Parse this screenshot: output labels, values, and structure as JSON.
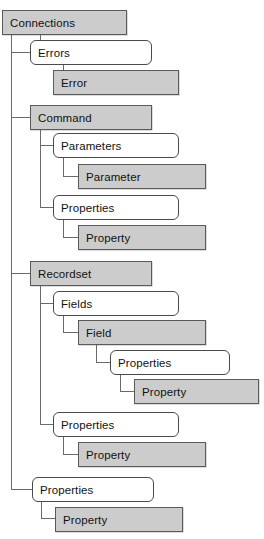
{
  "diagram": {
    "type": "tree-hierarchy",
    "colors": {
      "object_fill": "#cccccc",
      "collection_fill": "#ffffff",
      "border": "#5a5a5a",
      "connector": "#6a6a6a",
      "text": "#111111"
    },
    "legend": {
      "object_shape": "square-cornered gray box",
      "collection_shape": "rounded-corner white box"
    },
    "nodes": [
      {
        "id": "connections",
        "label": "Connections",
        "kind": "object",
        "depth": 0,
        "x": 2,
        "y": 10,
        "w": 125,
        "h": 25
      },
      {
        "id": "errors",
        "label": "Errors",
        "kind": "collection",
        "depth": 1,
        "x": 30,
        "y": 40,
        "w": 122,
        "h": 25
      },
      {
        "id": "error",
        "label": "Error",
        "kind": "object",
        "depth": 2,
        "x": 53,
        "y": 70,
        "w": 126,
        "h": 25
      },
      {
        "id": "command",
        "label": "Command",
        "kind": "object",
        "depth": 1,
        "x": 30,
        "y": 105,
        "w": 122,
        "h": 25
      },
      {
        "id": "parameters",
        "label": "Parameters",
        "kind": "collection",
        "depth": 2,
        "x": 53,
        "y": 133,
        "w": 126,
        "h": 25
      },
      {
        "id": "parameter",
        "label": "Parameter",
        "kind": "object",
        "depth": 3,
        "x": 78,
        "y": 164,
        "w": 128,
        "h": 25
      },
      {
        "id": "cmd-properties",
        "label": "Properties",
        "kind": "collection",
        "depth": 2,
        "x": 53,
        "y": 195,
        "w": 126,
        "h": 25
      },
      {
        "id": "cmd-property",
        "label": "Property",
        "kind": "object",
        "depth": 3,
        "x": 78,
        "y": 225,
        "w": 128,
        "h": 25
      },
      {
        "id": "recordset",
        "label": "Recordset",
        "kind": "object",
        "depth": 1,
        "x": 30,
        "y": 261,
        "w": 122,
        "h": 25
      },
      {
        "id": "fields",
        "label": "Fields",
        "kind": "collection",
        "depth": 2,
        "x": 53,
        "y": 291,
        "w": 126,
        "h": 25
      },
      {
        "id": "field",
        "label": "Field",
        "kind": "object",
        "depth": 3,
        "x": 78,
        "y": 320,
        "w": 128,
        "h": 25
      },
      {
        "id": "field-properties",
        "label": "Properties",
        "kind": "collection",
        "depth": 4,
        "x": 110,
        "y": 350,
        "w": 120,
        "h": 25
      },
      {
        "id": "field-property",
        "label": "Property",
        "kind": "object",
        "depth": 5,
        "x": 134,
        "y": 379,
        "w": 125,
        "h": 25
      },
      {
        "id": "rs-properties",
        "label": "Properties",
        "kind": "collection",
        "depth": 2,
        "x": 53,
        "y": 412,
        "w": 126,
        "h": 25
      },
      {
        "id": "rs-property",
        "label": "Property",
        "kind": "object",
        "depth": 3,
        "x": 78,
        "y": 442,
        "w": 128,
        "h": 25
      },
      {
        "id": "conn-properties",
        "label": "Properties",
        "kind": "collection",
        "depth": 1,
        "x": 32,
        "y": 477,
        "w": 122,
        "h": 25
      },
      {
        "id": "conn-property",
        "label": "Property",
        "kind": "object",
        "depth": 2,
        "x": 55,
        "y": 507,
        "w": 128,
        "h": 25
      }
    ],
    "edges": [
      {
        "from": "connections",
        "to": "errors"
      },
      {
        "from": "connections",
        "to": "command"
      },
      {
        "from": "connections",
        "to": "recordset"
      },
      {
        "from": "connections",
        "to": "conn-properties"
      },
      {
        "from": "errors",
        "to": "error"
      },
      {
        "from": "command",
        "to": "parameters"
      },
      {
        "from": "command",
        "to": "cmd-properties"
      },
      {
        "from": "parameters",
        "to": "parameter"
      },
      {
        "from": "cmd-properties",
        "to": "cmd-property"
      },
      {
        "from": "recordset",
        "to": "fields"
      },
      {
        "from": "recordset",
        "to": "rs-properties"
      },
      {
        "from": "fields",
        "to": "field"
      },
      {
        "from": "field",
        "to": "field-properties"
      },
      {
        "from": "field-properties",
        "to": "field-property"
      },
      {
        "from": "rs-properties",
        "to": "rs-property"
      },
      {
        "from": "conn-properties",
        "to": "conn-property"
      }
    ],
    "connectors": [
      {
        "name": "trunk-connections",
        "orient": "v",
        "x": 11,
        "y": 35,
        "len": 455
      },
      {
        "name": "stub-errors",
        "orient": "v",
        "x": 40,
        "y": 35,
        "len": 18
      },
      {
        "name": "elbow-errors",
        "orient": "h",
        "x": 11,
        "y": 52,
        "len": 19
      },
      {
        "name": "elbow-errors-in",
        "orient": "h",
        "x": 40,
        "y": 52,
        "len": 13
      },
      {
        "name": "stub-error",
        "orient": "v",
        "x": 63,
        "y": 65,
        "len": 18
      },
      {
        "name": "elbow-error",
        "orient": "h",
        "x": 63,
        "y": 82,
        "len": 15
      },
      {
        "name": "elbow-command",
        "orient": "h",
        "x": 11,
        "y": 117,
        "len": 20
      },
      {
        "name": "stub-command-down",
        "orient": "v",
        "x": 40,
        "y": 130,
        "len": 78
      },
      {
        "name": "elbow-parameters",
        "orient": "h",
        "x": 40,
        "y": 145,
        "len": 14
      },
      {
        "name": "stub-parameters",
        "orient": "v",
        "x": 63,
        "y": 158,
        "len": 19
      },
      {
        "name": "elbow-parameter",
        "orient": "h",
        "x": 63,
        "y": 176,
        "len": 16
      },
      {
        "name": "elbow-cmdprops",
        "orient": "h",
        "x": 40,
        "y": 207,
        "len": 14
      },
      {
        "name": "stub-cmdprops",
        "orient": "v",
        "x": 63,
        "y": 220,
        "len": 18
      },
      {
        "name": "elbow-cmdproperty",
        "orient": "h",
        "x": 63,
        "y": 237,
        "len": 16
      },
      {
        "name": "elbow-recordset",
        "orient": "h",
        "x": 11,
        "y": 273,
        "len": 20
      },
      {
        "name": "stub-recordset-down",
        "orient": "v",
        "x": 40,
        "y": 286,
        "len": 138
      },
      {
        "name": "elbow-fields",
        "orient": "h",
        "x": 40,
        "y": 303,
        "len": 14
      },
      {
        "name": "stub-fields",
        "orient": "v",
        "x": 63,
        "y": 316,
        "len": 17
      },
      {
        "name": "elbow-field",
        "orient": "h",
        "x": 63,
        "y": 332,
        "len": 16
      },
      {
        "name": "stub-field",
        "orient": "v",
        "x": 96,
        "y": 345,
        "len": 18
      },
      {
        "name": "elbow-fieldprops",
        "orient": "h",
        "x": 96,
        "y": 362,
        "len": 15
      },
      {
        "name": "stub-fieldprops",
        "orient": "v",
        "x": 120,
        "y": 375,
        "len": 17
      },
      {
        "name": "elbow-fieldprop",
        "orient": "h",
        "x": 120,
        "y": 391,
        "len": 15
      },
      {
        "name": "elbow-rsprops",
        "orient": "h",
        "x": 40,
        "y": 424,
        "len": 14
      },
      {
        "name": "stub-rsprops",
        "orient": "v",
        "x": 63,
        "y": 437,
        "len": 18
      },
      {
        "name": "elbow-rsproperty",
        "orient": "h",
        "x": 63,
        "y": 454,
        "len": 16
      },
      {
        "name": "elbow-connprops",
        "orient": "h",
        "x": 11,
        "y": 489,
        "len": 22
      },
      {
        "name": "stub-connprops",
        "orient": "v",
        "x": 41,
        "y": 502,
        "len": 17
      },
      {
        "name": "elbow-connproperty",
        "orient": "h",
        "x": 41,
        "y": 518,
        "len": 15
      }
    ]
  }
}
